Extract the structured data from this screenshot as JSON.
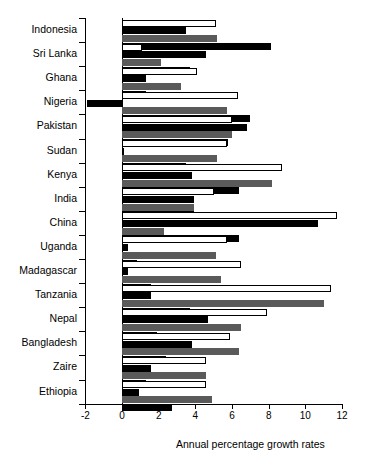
{
  "chart_data": {
    "type": "bar",
    "orientation": "horizontal",
    "title": "",
    "xlabel": "Annual percentage growth rates",
    "ylabel": "",
    "xlim": [
      -2,
      12
    ],
    "xticks": [
      -2,
      0,
      2,
      4,
      6,
      8,
      10,
      12
    ],
    "xticklabels": [
      "-2",
      "0",
      "2",
      "4",
      "6",
      "8",
      "10",
      "12"
    ],
    "grid": false,
    "legend": "none",
    "zero_reference_line": true,
    "categories": [
      "Indonesia",
      "Sri Lanka",
      "Ghana",
      "Nigeria",
      "Pakistan",
      "Sudan",
      "Kenya",
      "India",
      "China",
      "Uganda",
      "Madagascar",
      "Tanzania",
      "Nepal",
      "Bangladesh",
      "Zaire",
      "Ethiopia"
    ],
    "series": [
      {
        "name": "series-1",
        "style": "white",
        "color": "#ffffff",
        "values": [
          5.1,
          1.1,
          4.1,
          6.3,
          6.0,
          5.7,
          8.7,
          5.0,
          11.7,
          5.7,
          6.5,
          11.4,
          7.9,
          5.9,
          4.6,
          4.6
        ]
      },
      {
        "name": "series-2",
        "style": "black",
        "color": "#000000",
        "values": [
          3.5,
          4.6,
          1.3,
          -1.9,
          6.8,
          0.1,
          3.8,
          3.9,
          10.7,
          0.3,
          0.3,
          1.6,
          4.7,
          3.8,
          1.6,
          0.9
        ]
      },
      {
        "name": "series-3",
        "style": "gray",
        "color": "#5a5a5a",
        "values": [
          5.2,
          2.1,
          3.2,
          5.7,
          6.0,
          5.2,
          8.2,
          3.9,
          2.3,
          5.1,
          5.4,
          11.0,
          6.5,
          6.4,
          4.6,
          4.9
        ]
      },
      {
        "name": "series-4",
        "style": "black",
        "color": "#000000",
        "values": [
          8.1,
          3.7,
          1.3,
          7.0,
          5.8,
          3.5,
          6.4,
          3.9,
          6.4,
          0.8,
          1.6,
          3.7,
          1.9,
          2.4,
          1.3,
          2.7
        ]
      }
    ]
  }
}
